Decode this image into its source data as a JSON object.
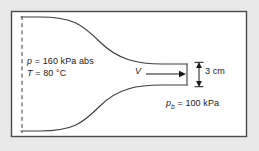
{
  "figure": {
    "type": "engineering-schematic",
    "frame": {
      "x": 11,
      "y": 11,
      "width": 236,
      "height": 126,
      "border_color": "#4a4a4a",
      "fill_color": "#ffffff"
    },
    "background_color": "#e9e9e9",
    "line_color": "#3c3c3c",
    "text_color": "#1a1a1a"
  },
  "labels": {
    "inlet_pressure": "p = 160 kPa abs",
    "inlet_pressure_symbol": "p",
    "inlet_pressure_value": "= 160 kPa abs",
    "inlet_temperature": "T = 80 °C",
    "inlet_temperature_symbol": "T",
    "inlet_temperature_value": "= 80 °C",
    "velocity_symbol": "V",
    "exit_diameter": "3 cm",
    "back_pressure_symbol": "p",
    "back_pressure_subscript": "b",
    "back_pressure_value": "= 100 kPa"
  },
  "geometry": {
    "centerline": {
      "name": "inlet-reference-dashed-line",
      "x": 22,
      "y_top": 17,
      "y_bottom": 133,
      "style": "dashed"
    },
    "upper_contour": {
      "name": "upper-nozzle-wall",
      "start": [
        22,
        17
      ],
      "end": [
        187,
        64
      ],
      "control_points": [
        [
          78,
          18
        ],
        [
          120,
          62
        ],
        [
          187,
          64
        ]
      ]
    },
    "lower_contour": {
      "name": "lower-nozzle-wall",
      "start": [
        22,
        131
      ],
      "end": [
        187,
        85
      ],
      "control_points": [
        [
          78,
          130
        ],
        [
          120,
          87
        ],
        [
          187,
          85
        ]
      ]
    },
    "exit_plane": {
      "name": "nozzle-exit-plane",
      "x": 187,
      "y_top": 64,
      "y_bottom": 85
    },
    "velocity_arrow": {
      "name": "velocity-arrow",
      "x_start": 146,
      "x_end": 186,
      "y": 74
    },
    "dimension_arrow": {
      "name": "exit-height-dimension-arrow",
      "x": 199,
      "y_top": 63,
      "y_bottom": 86
    }
  }
}
